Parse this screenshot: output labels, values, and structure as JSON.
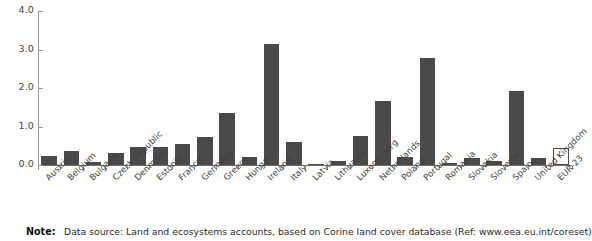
{
  "chart_data": {
    "type": "bar",
    "title": "",
    "subtitle": "",
    "xlabel": "",
    "ylabel": "",
    "ylim": [
      0.0,
      4.0
    ],
    "yticks": [
      "0.0",
      "1.0",
      "2.0",
      "3.0",
      "4.0"
    ],
    "ytick_values": [
      0.0,
      1.0,
      2.0,
      3.0,
      4.0
    ],
    "grid": false,
    "legend": "none",
    "categories": [
      "Austria",
      "Belgium",
      "Bulgaria",
      "Czech Republic",
      "Denmark",
      "Estonia",
      "France",
      "Germany",
      "Greece",
      "Hungary",
      "Ireland",
      "Italy",
      "Latvia",
      "Lithuania",
      "Luxembourg",
      "Netherlands",
      "Poland",
      "Portugal",
      "Romania",
      "Slovakia",
      "Slovenia",
      "Spain",
      "United Kingdom",
      "EUR-23"
    ],
    "values": [
      0.24,
      0.36,
      0.07,
      0.31,
      0.47,
      0.46,
      0.54,
      0.72,
      1.35,
      0.2,
      3.14,
      0.61,
      0.03,
      0.1,
      0.75,
      1.66,
      0.2,
      2.79,
      0.06,
      0.17,
      0.1,
      1.92,
      0.18,
      0.45
    ],
    "series": [
      {
        "name": "Land take",
        "values": [
          0.24,
          0.36,
          0.07,
          0.31,
          0.47,
          0.46,
          0.54,
          0.72,
          1.35,
          0.2,
          3.14,
          0.61,
          0.03,
          0.1,
          0.75,
          1.66,
          0.2,
          2.79,
          0.06,
          0.17,
          0.1,
          1.92,
          0.18,
          0.45
        ]
      }
    ],
    "bar_styles": [
      "filled",
      "filled",
      "filled",
      "filled",
      "filled",
      "filled",
      "filled",
      "filled",
      "filled",
      "filled",
      "filled",
      "filled",
      "filled",
      "filled",
      "filled",
      "filled",
      "filled",
      "filled",
      "filled",
      "filled",
      "filled",
      "filled",
      "filled",
      "hollow"
    ],
    "colors": {
      "bar_fill": "#4a4a4a",
      "bar_outline": "#4a4a4a",
      "aggregate_fill": "#ffffff",
      "axis": "#9a9a9a",
      "text": "#3f3f3f"
    }
  },
  "note": {
    "label": "Note:",
    "text": "Data source: Land and ecosystems accounts, based on Corine land cover database (Ref: www.eea.eu.int/coreset)"
  }
}
